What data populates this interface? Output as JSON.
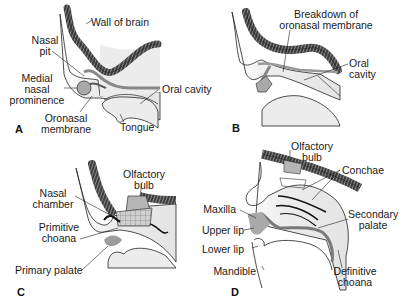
{
  "figure": {
    "panels": [
      {
        "letter": "A",
        "labels": {
          "wall_of_brain": "Wall of brain",
          "nasal_pit_1": "Nasal",
          "nasal_pit_2": "pit",
          "medial_1": "Medial",
          "medial_2": "nasal",
          "medial_3": "prominence",
          "oral_cavity": "Oral cavity",
          "oronasal_1": "Oronasal",
          "oronasal_2": "membrane",
          "tongue": "Tongue"
        }
      },
      {
        "letter": "B",
        "labels": {
          "breakdown_1": "Breakdown of",
          "breakdown_2": "oronasal membrane",
          "oral_1": "Oral",
          "oral_2": "cavity"
        }
      },
      {
        "letter": "C",
        "labels": {
          "olfactory_1": "Olfactory",
          "olfactory_2": "bulb",
          "nasal_chamber_1": "Nasal",
          "nasal_chamber_2": "chamber",
          "primitive_1": "Primitive",
          "primitive_2": "choana",
          "primary_palate": "Primary palate"
        }
      },
      {
        "letter": "D",
        "labels": {
          "olfactory_1": "Olfactory",
          "olfactory_2": "bulb",
          "conchae": "Conchae",
          "maxilla": "Maxilla",
          "secondary_1": "Secondary",
          "secondary_2": "palate",
          "upper_lip": "Upper lip",
          "lower_lip": "Lower lip",
          "mandible": "Mandible",
          "definitive_1": "Definitive",
          "definitive_2": "choana"
        }
      }
    ],
    "colors": {
      "tissue_fill": "#ececec",
      "brain_wall": "#4a4a4a",
      "prominence": "#a9a9a9",
      "palate": "#8c8c8c",
      "outline": "#222222"
    }
  }
}
